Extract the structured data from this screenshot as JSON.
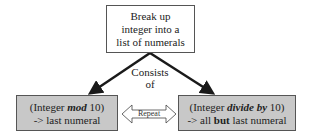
{
  "diagram": {
    "top_box": {
      "lines": [
        "Break up",
        "integer into a",
        "list of numerals"
      ]
    },
    "connector_label": {
      "lines": [
        "Consists",
        "of"
      ]
    },
    "left_box": {
      "line1_prefix": "(Integer ",
      "line1_emph": "mod",
      "line1_suffix": " 10)",
      "line2": "-> last numeral",
      "fill_color": "#c8c8c8"
    },
    "right_box": {
      "line1_prefix": "(Integer ",
      "line1_emph": "divide by",
      "line1_suffix": " 10)",
      "line2_prefix": "-> all ",
      "line2_bold": "but",
      "line2_suffix": " last numeral",
      "fill_color": "#c8c8c8"
    },
    "repeat_arrow": {
      "label": "Repeat"
    }
  }
}
